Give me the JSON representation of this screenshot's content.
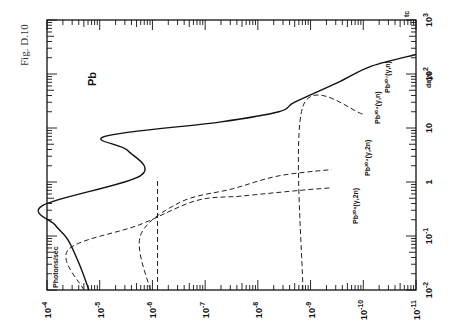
{
  "figure_label": "Fig. D.10",
  "chart_data": {
    "type": "line",
    "orientation": "rotated-90-ccw",
    "title": "Pb",
    "xlabel": "Photons/sec",
    "ylabel": "t_c days",
    "x_axis": {
      "scale": "log",
      "range": [
        0.0001,
        1e-11
      ],
      "ticks": [
        {
          "value": 0.0001,
          "label": "10^-4"
        },
        {
          "value": 1e-05,
          "label": "10^-5"
        },
        {
          "value": 1e-06,
          "label": "10^-6"
        },
        {
          "value": 1e-07,
          "label": "10^-7"
        },
        {
          "value": 1e-08,
          "label": "10^-8"
        },
        {
          "value": 1e-09,
          "label": "10^-9"
        },
        {
          "value": 1e-10,
          "label": "10^-10"
        },
        {
          "value": 1e-11,
          "label": "10^-11"
        }
      ]
    },
    "y_axis": {
      "scale": "log",
      "range": [
        0.01,
        1000
      ],
      "ticks": [
        {
          "value": 0.01,
          "label": "10^-2"
        },
        {
          "value": 0.1,
          "label": "10^-1"
        },
        {
          "value": 1,
          "label": "1"
        },
        {
          "value": 10,
          "label": "10"
        },
        {
          "value": 100,
          "label": "10^2"
        },
        {
          "value": 1000,
          "label": "10^3"
        }
      ]
    },
    "series": [
      {
        "name": "total",
        "style": "solid",
        "points": [
          [
            1.6e-05,
            0.01
          ],
          [
            2.4e-05,
            0.029
          ],
          [
            4e-05,
            0.085
          ],
          [
            7e-05,
            0.16
          ],
          [
            0.00012,
            0.37
          ],
          [
            1.7e-06,
            1.3
          ],
          [
            2.9e-06,
            3.8
          ],
          [
            8e-06,
            7.0
          ],
          [
            5e-08,
            13
          ],
          [
            4e-09,
            20
          ],
          [
            2e-09,
            30
          ],
          [
            3e-10,
            70
          ],
          [
            7e-11,
            140
          ],
          [
            1e-11,
            230
          ]
        ]
      },
      {
        "name": "Pb206(γ,2n)",
        "style": "dashed",
        "points": [
          [
            2e-05,
            0.01
          ],
          [
            4e-05,
            0.055
          ],
          [
            1.8e-06,
            0.16
          ],
          [
            1.5e-07,
            0.45
          ],
          [
            2e-08,
            0.55
          ],
          [
            1.6e-09,
            0.7
          ],
          [
            4e-10,
            0.78
          ]
        ]
      },
      {
        "name": "Pb204(γ,2n)",
        "style": "dashed",
        "points": [
          [
            1.1e-06,
            0.01
          ],
          [
            1.7e-06,
            0.1
          ],
          [
            3e-07,
            0.42
          ],
          [
            3e-08,
            0.75
          ],
          [
            4e-09,
            1.3
          ],
          [
            4e-10,
            1.7
          ]
        ]
      },
      {
        "name": "Pb204(γ,n)",
        "style": "dashed",
        "points": [
          [
            1.4e-09,
            0.01
          ],
          [
            1.4e-09,
            25
          ],
          [
            1e-10,
            18
          ]
        ]
      },
      {
        "name": "Pb207(γ,n)",
        "style": "dashed",
        "points": [
          [
            8e-07,
            0.01
          ],
          [
            8e-07,
            1.2
          ]
        ]
      }
    ],
    "annotations": [
      {
        "text": "Pb",
        "role": "element"
      },
      {
        "text": "Pb206(γ,2n)",
        "role": "curve-label"
      },
      {
        "text": "Pb204(γ,2n)",
        "role": "curve-label"
      },
      {
        "text": "Pb204(γ,n)",
        "role": "curve-label"
      },
      {
        "text": "Pb207(γ,n)",
        "role": "curve-label"
      }
    ],
    "grid": false
  },
  "labels": {
    "element": "Pb",
    "xlabel": "Photons/sec",
    "ylabel_tc": "tc",
    "ylabel_days": "days",
    "ann_206_2n": "Pb²⁰⁶(γ,2n)",
    "ann_204_2n": "Pb²⁰⁴(γ,2n)",
    "ann_204_n": "Pb²⁰⁴(γ,n)",
    "ann_207_n": "Pb²⁰⁷(γ,n)"
  }
}
